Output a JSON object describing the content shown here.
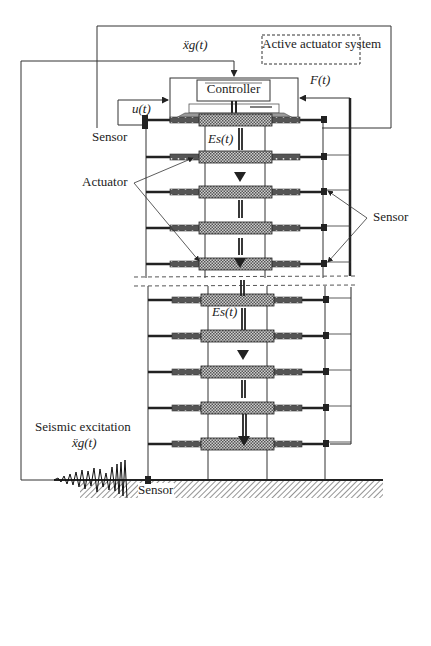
{
  "diagram": {
    "type": "building-active-control-schematic",
    "labels": {
      "active_system": "Active actuator system",
      "controller": "Controller",
      "ground_accel_top": "ẍg(t)",
      "force": "F(t)",
      "control_signal": "u(t)",
      "sensor_top_left": "Sensor",
      "energy_upper": "Es(t)",
      "energy_lower": "Es(t)",
      "actuator": "Actuator",
      "sensor_right": "Sensor",
      "seismic_excitation": "Seismic excitation",
      "ground_accel_bottom": "ẍg(t)",
      "sensor_ground": "Sensor"
    },
    "structure": {
      "upper_floors": 5,
      "lower_floors": 5,
      "columns": 4,
      "has_break_line": true
    },
    "caption": ""
  }
}
